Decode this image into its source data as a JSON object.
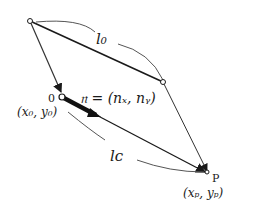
{
  "diagram": {
    "points": {
      "top": {
        "label": ""
      },
      "right": {
        "label": ""
      },
      "origin": {
        "label": "0",
        "coords": "(x₀, y₀)"
      },
      "target": {
        "label": "P",
        "coords": "(xₚ, yₚ)"
      }
    },
    "normal_vector": {
      "label": "𝔫 = (nₓ, nᵧ)"
    },
    "arcs": {
      "upper": {
        "label": "l₀"
      },
      "lower": {
        "label": "lᴄ"
      }
    },
    "colors": {
      "stroke": "#1a1a1a",
      "arc": "#555555",
      "background": "#ffffff"
    }
  }
}
